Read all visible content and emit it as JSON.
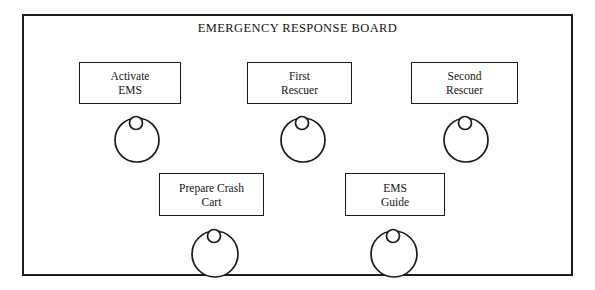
{
  "board": {
    "title": "EMERGENCY RESPONSE BOARD",
    "frame_color": "#1d1d1d",
    "background_color": "#ffffff",
    "text_color": "#141414"
  },
  "nodes": [
    {
      "id": "activate-ems",
      "line1": "Activate",
      "line2": "EMS",
      "x": 79,
      "y": 62,
      "width": 102,
      "height": 42,
      "figure_cx": 137,
      "figure_cy": 140,
      "figure_r": 22
    },
    {
      "id": "first-rescuer",
      "line1": "First",
      "line2": "Rescuer",
      "x": 247,
      "y": 62,
      "width": 105,
      "height": 42,
      "figure_cx": 303,
      "figure_cy": 140,
      "figure_r": 22
    },
    {
      "id": "second-rescuer",
      "line1": "Second",
      "line2": "Rescuer",
      "x": 411,
      "y": 62,
      "width": 107,
      "height": 42,
      "figure_cx": 466,
      "figure_cy": 140,
      "figure_r": 22
    },
    {
      "id": "prepare-crash-cart",
      "line1": "Prepare Crash",
      "line2": "Cart",
      "x": 159,
      "y": 173,
      "width": 105,
      "height": 43,
      "figure_cx": 215,
      "figure_cy": 254,
      "figure_r": 23
    },
    {
      "id": "ems-guide",
      "line1": "EMS",
      "line2": "Guide",
      "x": 345,
      "y": 173,
      "width": 100,
      "height": 43,
      "figure_cx": 394,
      "figure_cy": 254,
      "figure_r": 23
    }
  ],
  "figure": {
    "icon_name": "person-figure-icon",
    "head_radius": 6.5,
    "head_offset_y": -17,
    "head_offset_x": -1
  }
}
